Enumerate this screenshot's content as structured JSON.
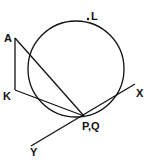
{
  "diagram": {
    "type": "geometry",
    "labels": {
      "A": "A",
      "K": "K",
      "L": "L",
      "PQ": "P,Q",
      "X": "X",
      "Y": "Y"
    },
    "caption": "",
    "colors": {
      "stroke": "#111111",
      "background": "#ffffff"
    },
    "elements": {
      "circle": {
        "cx": 76,
        "cy": 69,
        "r": 48
      },
      "points": {
        "A": [
          15,
          38
        ],
        "K": [
          15,
          90
        ],
        "L": [
          89,
          19
        ],
        "P": [
          84,
          116
        ]
      },
      "segments": [
        "A-K",
        "A-P",
        "K-P"
      ],
      "tangent_line": {
        "from": [
          31,
          146
        ],
        "to": [
          135,
          84
        ]
      }
    }
  }
}
